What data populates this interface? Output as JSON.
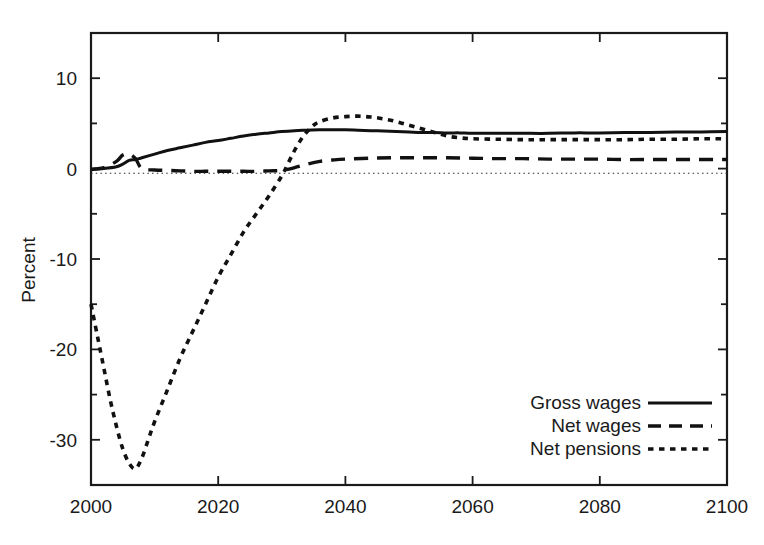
{
  "chart_data": {
    "type": "line",
    "title": "",
    "xlabel": "",
    "ylabel": "Percent",
    "xlim": [
      2000,
      2100
    ],
    "ylim": [
      -35,
      15
    ],
    "grid": false,
    "zero_reference_line": true,
    "legend_position": "bottom-right",
    "x_ticks": [
      2000,
      2020,
      2040,
      2060,
      2080,
      2100
    ],
    "x_tick_labels": [
      "2000",
      "2020",
      "2040",
      "2060",
      "2080",
      "2100"
    ],
    "x_minor_ticks": [
      2010,
      2030,
      2050,
      2070,
      2090
    ],
    "y_ticks": [
      10,
      0,
      -10,
      -20,
      -30
    ],
    "y_tick_labels": [
      "10",
      "0",
      "-10",
      "-20",
      "-30"
    ],
    "y_minor_ticks": [
      15,
      5,
      -5,
      -15,
      -25,
      -35
    ],
    "series": [
      {
        "name": "Gross wages",
        "style": "solid",
        "x": [
          2000,
          2002,
          2004,
          2005,
          2006,
          2007,
          2008,
          2010,
          2012,
          2014,
          2016,
          2018,
          2020,
          2022,
          2024,
          2026,
          2028,
          2030,
          2032,
          2034,
          2036,
          2038,
          2040,
          2042,
          2044,
          2046,
          2048,
          2050,
          2052,
          2054,
          2056,
          2058,
          2060,
          2064,
          2068,
          2072,
          2076,
          2080,
          2084,
          2088,
          2092,
          2096,
          2100
        ],
        "values": [
          -0.1,
          0.0,
          0.2,
          0.5,
          0.9,
          1.0,
          1.2,
          1.6,
          2.0,
          2.3,
          2.6,
          2.9,
          3.1,
          3.35,
          3.6,
          3.8,
          3.95,
          4.1,
          4.2,
          4.25,
          4.3,
          4.3,
          4.3,
          4.25,
          4.2,
          4.15,
          4.1,
          4.05,
          4.0,
          4.0,
          3.95,
          3.95,
          3.9,
          3.9,
          3.9,
          3.9,
          3.95,
          3.95,
          4.0,
          4.0,
          4.05,
          4.05,
          4.1
        ]
      },
      {
        "name": "Net wages",
        "style": "dashed",
        "x": [
          2000,
          2002,
          2004,
          2005,
          2006,
          2007,
          2008,
          2010,
          2012,
          2014,
          2016,
          2018,
          2020,
          2022,
          2024,
          2026,
          2028,
          2030,
          2032,
          2034,
          2036,
          2038,
          2040,
          2044,
          2048,
          2052,
          2056,
          2060,
          2064,
          2068,
          2072,
          2076,
          2080,
          2084,
          2088,
          2092,
          2096,
          2100
        ],
        "values": [
          -0.1,
          0.1,
          0.8,
          1.5,
          1.6,
          1.1,
          0.0,
          -0.15,
          -0.2,
          -0.25,
          -0.3,
          -0.3,
          -0.3,
          -0.3,
          -0.3,
          -0.3,
          -0.25,
          -0.2,
          0.1,
          0.5,
          0.8,
          0.95,
          1.05,
          1.15,
          1.2,
          1.2,
          1.2,
          1.15,
          1.1,
          1.1,
          1.05,
          1.05,
          1.05,
          1.0,
          1.0,
          1.0,
          1.0,
          1.0
        ]
      },
      {
        "name": "Net pensions",
        "style": "dotted",
        "x": [
          2000,
          2001,
          2002,
          2003,
          2004,
          2005,
          2006,
          2007,
          2008,
          2009,
          2010,
          2012,
          2014,
          2016,
          2018,
          2020,
          2022,
          2024,
          2026,
          2028,
          2030,
          2031,
          2032,
          2033,
          2034,
          2035,
          2036,
          2038,
          2040,
          2042,
          2044,
          2046,
          2048,
          2050,
          2052,
          2054,
          2056,
          2058,
          2060,
          2064,
          2068,
          2072,
          2076,
          2080,
          2084,
          2088,
          2092,
          2096,
          2100
        ],
        "values": [
          -15.0,
          -18.5,
          -22.0,
          -25.5,
          -28.5,
          -31.0,
          -32.6,
          -33.2,
          -32.0,
          -30.0,
          -28.0,
          -24.5,
          -21.0,
          -18.0,
          -15.0,
          -12.0,
          -9.5,
          -7.0,
          -5.0,
          -3.0,
          -0.8,
          0.6,
          2.0,
          3.2,
          4.1,
          4.8,
          5.2,
          5.6,
          5.75,
          5.8,
          5.7,
          5.5,
          5.2,
          4.8,
          4.4,
          4.0,
          3.6,
          3.4,
          3.3,
          3.25,
          3.2,
          3.2,
          3.2,
          3.2,
          3.2,
          3.25,
          3.25,
          3.3,
          3.3
        ]
      }
    ]
  },
  "legend": {
    "entries": [
      {
        "label": "Gross wages",
        "style": "solid"
      },
      {
        "label": "Net wages",
        "style": "dashed"
      },
      {
        "label": "Net pensions",
        "style": "dotted"
      }
    ]
  },
  "axes": {
    "y_title": "Percent"
  }
}
